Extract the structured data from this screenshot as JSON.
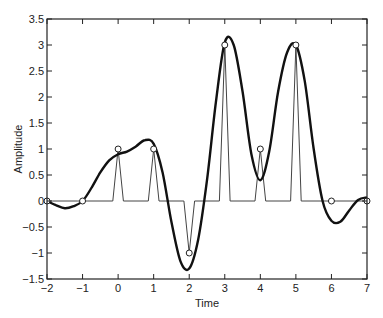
{
  "chart_data": {
    "type": "line",
    "title": "",
    "xlabel": "Time",
    "ylabel": "Amplitude",
    "xlim": [
      -2,
      7
    ],
    "ylim": [
      -1.5,
      3.5
    ],
    "xticks": [
      -2,
      -1,
      0,
      1,
      2,
      3,
      4,
      5,
      6,
      7
    ],
    "xtick_labels": [
      "−2",
      "−1",
      "0",
      "1",
      "2",
      "3",
      "4",
      "5",
      "6",
      "7"
    ],
    "yticks": [
      -1.5,
      -1,
      -0.5,
      0,
      0.5,
      1,
      1.5,
      2,
      2.5,
      3,
      3.5
    ],
    "ytick_labels": [
      "−1.5",
      "−1",
      "−0.5",
      "0",
      "0.5",
      "1",
      "1.5",
      "2",
      "2.5",
      "3",
      "3.5"
    ],
    "grid": false,
    "legend": null,
    "series": [
      {
        "name": "samples",
        "style": "markers-circle",
        "x": [
          -2,
          -1,
          0,
          1,
          2,
          3,
          4,
          5,
          6,
          7
        ],
        "y": [
          0,
          0,
          1,
          1,
          -1,
          3,
          1,
          3,
          0,
          0
        ]
      },
      {
        "name": "pulse train",
        "style": "thin-line",
        "pulse_half_width": 0.15,
        "x": [
          -2,
          -1,
          0,
          1,
          2,
          3,
          4,
          5,
          6,
          7
        ],
        "y": [
          0,
          0,
          1,
          1,
          -1,
          3,
          1,
          3,
          0,
          0
        ]
      },
      {
        "name": "interpolated signal",
        "style": "thick-line",
        "x": [
          -2,
          -1.75,
          -1.5,
          -1.25,
          -1,
          -0.75,
          -0.5,
          -0.25,
          0,
          0.25,
          0.5,
          0.75,
          1,
          1.25,
          1.5,
          1.75,
          2,
          2.25,
          2.5,
          2.75,
          3,
          3.25,
          3.5,
          3.75,
          4,
          4.25,
          4.5,
          4.75,
          5,
          5.25,
          5.5,
          5.75,
          6,
          6.25,
          6.5,
          6.75,
          7
        ],
        "y": [
          0,
          -0.08,
          -0.14,
          -0.1,
          0,
          0.25,
          0.55,
          0.78,
          0.9,
          0.95,
          1.05,
          1.17,
          1.1,
          0.55,
          -0.4,
          -1.15,
          -1.3,
          -0.75,
          0.4,
          1.9,
          3.05,
          3.0,
          2.1,
          0.9,
          0.4,
          0.95,
          2.1,
          2.85,
          3.0,
          2.3,
          1.0,
          0.0,
          -0.38,
          -0.4,
          -0.18,
          0.02,
          0.07
        ]
      }
    ]
  }
}
